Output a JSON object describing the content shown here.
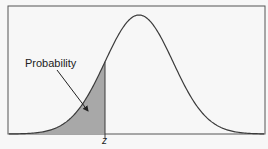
{
  "chart_data": {
    "type": "area",
    "title": "",
    "annotation_label": "Probability",
    "x_marker_label": "z",
    "distribution": {
      "kind": "normal",
      "mean": 0,
      "std": 1
    },
    "shaded_region": {
      "from": "-inf",
      "to": "z",
      "z_approx": -1.0
    },
    "xlabel": "",
    "ylabel": "",
    "grid": false,
    "legend": null
  },
  "render": {
    "box": {
      "x": 8,
      "y": 6,
      "w": 257,
      "h": 128
    },
    "mean_px": 139,
    "sigma_px": 34,
    "peak_y": 15,
    "baseline_y": 134,
    "z_px": 105,
    "z_line_bottom": 138,
    "arrow": {
      "x1": 57,
      "y1": 70,
      "x2": 88,
      "y2": 111
    },
    "colors": {
      "stroke": "#3a3a3a",
      "fill": "#a8a8a8",
      "box": "#555555",
      "bg": "#f7f7f7"
    }
  },
  "labels": {
    "probability": "Probability",
    "z": "z"
  }
}
